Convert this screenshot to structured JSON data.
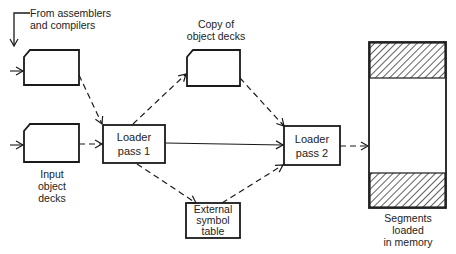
{
  "diagram": {
    "type": "flowchart",
    "colors": {
      "stroke": "#1a1a1a",
      "background": "#ffffff"
    },
    "labels": {
      "source_line1": "From assemblers",
      "source_line2": "and compilers",
      "input_line1": "Input",
      "input_line2": "object",
      "input_line3": "decks",
      "copy_line1": "Copy of",
      "copy_line2": "object decks",
      "memory_line1": "Segments",
      "memory_line2": "loaded",
      "memory_line3": "in memory"
    },
    "boxes": {
      "pass1_line1": "Loader",
      "pass1_line2": "pass 1",
      "pass2_line1": "Loader",
      "pass2_line2": "pass 2",
      "est_line1": "External",
      "est_line2": "symbol",
      "est_line3": "table"
    },
    "edges": [
      {
        "from": "assemblers-and-compilers",
        "to": "object-deck-top",
        "style": "solid"
      },
      {
        "from": "object-deck-top",
        "to": "loader-pass-1",
        "style": "dashed"
      },
      {
        "from": "input-object-decks",
        "to": "loader-pass-1",
        "style": "dashed"
      },
      {
        "from": "loader-pass-1",
        "to": "copy-of-object-decks",
        "style": "dashed"
      },
      {
        "from": "loader-pass-1",
        "to": "external-symbol-table",
        "style": "dashed"
      },
      {
        "from": "loader-pass-1",
        "to": "loader-pass-2",
        "style": "solid"
      },
      {
        "from": "copy-of-object-decks",
        "to": "loader-pass-2",
        "style": "dashed"
      },
      {
        "from": "external-symbol-table",
        "to": "loader-pass-2",
        "style": "dashed"
      },
      {
        "from": "loader-pass-2",
        "to": "memory",
        "style": "dashed"
      }
    ]
  }
}
